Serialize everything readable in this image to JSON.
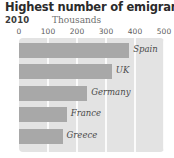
{
  "chart_data": {
    "type": "bar",
    "orientation": "horizontal",
    "title": "Highest number of emigrants",
    "subtitle": "2010",
    "xlabel": "Thousands",
    "ylabel": "",
    "categories": [
      "Spain",
      "UK",
      "Germany",
      "France",
      "Greece"
    ],
    "values": [
      380,
      320,
      235,
      165,
      150
    ],
    "xlim": [
      0,
      500
    ],
    "xticks": [
      0,
      100,
      200,
      300,
      400,
      500
    ],
    "xtick_labels": [
      "0",
      "100",
      "200",
      "300",
      "400",
      "500"
    ],
    "grid": true,
    "legend": false,
    "colors": {
      "bar": "#a8a8a8",
      "plot_background": "#e3e3e3",
      "gridline": "#fbfbfb",
      "title_text": "#2b2b2b",
      "tick_text": "#5c5c5c",
      "label_text": "#4a4a4a",
      "page_background": "#ffffff"
    }
  }
}
